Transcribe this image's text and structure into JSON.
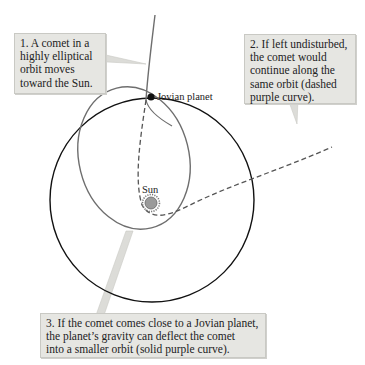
{
  "diagram": {
    "labels": {
      "jovian_planet": "Jovian planet",
      "sun": "Sun"
    },
    "callouts": [
      {
        "id": 1,
        "lines": [
          "1. A comet in a",
          "highly elliptical",
          "orbit moves",
          "toward the Sun."
        ]
      },
      {
        "id": 2,
        "lines": [
          "2. If left undisturbed,",
          "the comet would",
          "continue along the",
          "same orbit (dashed",
          "purple curve)."
        ]
      },
      {
        "id": 3,
        "lines": [
          "3. If the comet comes close to a Jovian planet,",
          "the planet’s gravity can deflect the comet",
          "into a smaller orbit (solid purple curve)."
        ]
      }
    ],
    "colors": {
      "planet_orbit": "#111111",
      "comet_orbit": "#6e6e6e",
      "callout_bg": "#e6e6e2",
      "sun_fill": "#9a9a9a"
    }
  }
}
